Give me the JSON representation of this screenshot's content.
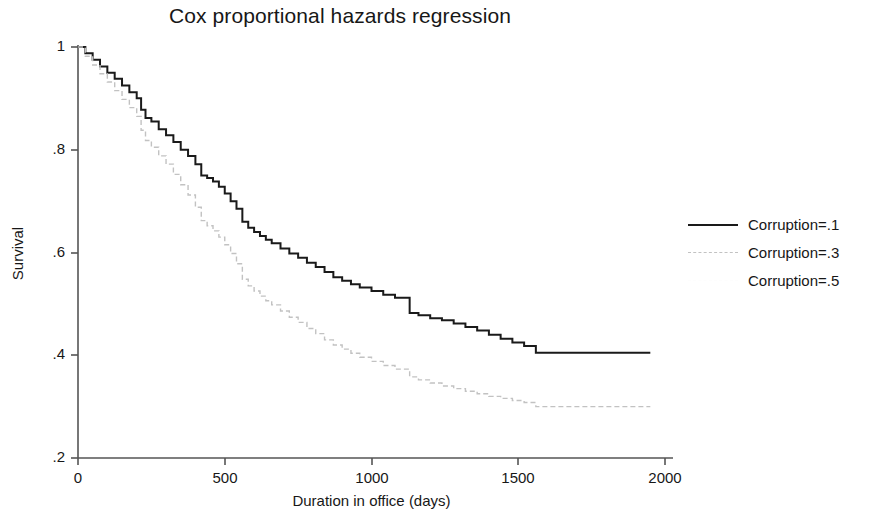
{
  "chart_data": {
    "type": "line",
    "title": "Cox proportional hazards regression",
    "xlabel": "Duration in office (days)",
    "ylabel": "Survival",
    "xlim": [
      0,
      2000
    ],
    "ylim": [
      0.2,
      1.0
    ],
    "xticks": [
      0,
      500,
      1000,
      1500,
      2000
    ],
    "xtick_labels": [
      "0",
      "500",
      "1000",
      "1500",
      "2000"
    ],
    "yticks": [
      0.2,
      0.4,
      0.6,
      0.8,
      1.0
    ],
    "ytick_labels": [
      ".2",
      ".4",
      ".6",
      ".8",
      "1"
    ],
    "grid": false,
    "legend_position": "right",
    "step_plot": true,
    "series": [
      {
        "name": "Corruption=.1",
        "color": "#1a1a1a",
        "style": "solid",
        "width": 2.0,
        "x": [
          0,
          25,
          50,
          75,
          100,
          125,
          150,
          175,
          200,
          215,
          230,
          250,
          275,
          300,
          325,
          350,
          375,
          400,
          420,
          440,
          460,
          480,
          500,
          520,
          540,
          560,
          580,
          600,
          620,
          640,
          660,
          690,
          720,
          750,
          780,
          810,
          840,
          870,
          900,
          930,
          960,
          1000,
          1040,
          1080,
          1100,
          1130,
          1160,
          1200,
          1240,
          1280,
          1320,
          1360,
          1400,
          1440,
          1480,
          1520,
          1560,
          1600,
          1700,
          1800,
          1950
        ],
        "y": [
          1.0,
          0.988,
          0.975,
          0.962,
          0.95,
          0.938,
          0.925,
          0.912,
          0.9,
          0.878,
          0.862,
          0.855,
          0.84,
          0.828,
          0.815,
          0.8,
          0.788,
          0.772,
          0.75,
          0.745,
          0.738,
          0.728,
          0.715,
          0.7,
          0.685,
          0.66,
          0.648,
          0.64,
          0.632,
          0.625,
          0.618,
          0.608,
          0.598,
          0.59,
          0.58,
          0.572,
          0.562,
          0.552,
          0.545,
          0.538,
          0.532,
          0.525,
          0.518,
          0.512,
          0.512,
          0.482,
          0.478,
          0.472,
          0.468,
          0.462,
          0.455,
          0.448,
          0.44,
          0.432,
          0.425,
          0.418,
          0.405,
          0.405,
          0.405,
          0.405,
          0.405
        ]
      },
      {
        "name": "Corruption=.3",
        "color": "#c2c2c2",
        "style": "dashed",
        "width": 1.4,
        "x": [
          0,
          25,
          50,
          75,
          100,
          125,
          150,
          175,
          200,
          215,
          230,
          250,
          275,
          300,
          325,
          350,
          375,
          400,
          420,
          440,
          460,
          480,
          500,
          520,
          540,
          560,
          580,
          600,
          620,
          640,
          660,
          690,
          720,
          750,
          780,
          810,
          840,
          870,
          900,
          930,
          960,
          1000,
          1040,
          1080,
          1100,
          1130,
          1160,
          1200,
          1240,
          1280,
          1320,
          1360,
          1400,
          1440,
          1480,
          1520,
          1560,
          1600,
          1700,
          1800,
          1950
        ],
        "y": [
          1.0,
          0.982,
          0.965,
          0.948,
          0.932,
          0.915,
          0.898,
          0.882,
          0.865,
          0.838,
          0.818,
          0.805,
          0.788,
          0.772,
          0.752,
          0.732,
          0.712,
          0.688,
          0.662,
          0.652,
          0.642,
          0.63,
          0.615,
          0.598,
          0.578,
          0.548,
          0.535,
          0.525,
          0.515,
          0.506,
          0.498,
          0.486,
          0.474,
          0.464,
          0.452,
          0.442,
          0.43,
          0.42,
          0.412,
          0.404,
          0.396,
          0.388,
          0.38,
          0.373,
          0.373,
          0.358,
          0.352,
          0.346,
          0.34,
          0.335,
          0.33,
          0.325,
          0.32,
          0.316,
          0.312,
          0.308,
          0.3,
          0.3,
          0.3,
          0.3,
          0.3
        ]
      },
      {
        "name": "Corruption=.5",
        "color": "#fdfdfd",
        "style": "dashed",
        "width": 1.2,
        "x": [],
        "y": []
      }
    ]
  },
  "axis": {
    "xticks": [
      {
        "label": "0",
        "px": 78
      },
      {
        "label": "500",
        "px": 225
      },
      {
        "label": "1000",
        "px": 372
      },
      {
        "label": "1500",
        "px": 518
      },
      {
        "label": "2000",
        "px": 665
      }
    ],
    "yticks": [
      {
        "label": "1",
        "px": 47
      },
      {
        "label": ".8",
        "px": 150
      },
      {
        "label": ".6",
        "px": 253
      },
      {
        "label": ".4",
        "px": 355
      },
      {
        "label": ".2",
        "px": 458
      }
    ]
  },
  "legend": {
    "entries": [
      {
        "label": "Corruption=.1",
        "swatch": "solid-dark"
      },
      {
        "label": "Corruption=.3",
        "swatch": "dashed-light"
      },
      {
        "label": "Corruption=.5",
        "swatch": "blank"
      }
    ]
  },
  "colors": {
    "axis": "#555555",
    "text": "#171717",
    "series_1": "#1a1a1a",
    "series_2": "#c2c2c2",
    "series_3": "#fdfdfd",
    "background": "#ffffff"
  }
}
